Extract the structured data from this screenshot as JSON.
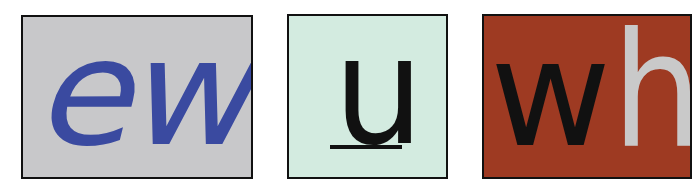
{
  "tiles": [
    {
      "id": "tile-ew",
      "text": "ew",
      "background": "#c8c8ca",
      "text_color": "#3a4aa0",
      "style": "italic"
    },
    {
      "id": "tile-u",
      "text": "u",
      "background": "#d3ebe0",
      "text_color": "#111111",
      "underline_color": "#111111",
      "style": "underlined"
    },
    {
      "id": "tile-wh",
      "letters": [
        {
          "char": "w",
          "color": "#111111"
        },
        {
          "char": "h",
          "color": "#c9c9c9"
        }
      ],
      "background": "#9e3a22"
    }
  ],
  "colors": {
    "border": "#111111",
    "page_background": "#ffffff"
  }
}
